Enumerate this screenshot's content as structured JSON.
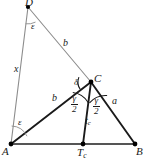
{
  "figure": {
    "type": "geometry-diagram",
    "width": 145,
    "height": 161,
    "background_color": "#ffffff",
    "colors": {
      "heavy_stroke": "#1a1a1a",
      "light_stroke": "#8c8c8c",
      "baseline_stroke": "#555555",
      "label_color": "#1a1a1a",
      "point_fill": "#000000"
    },
    "points": [
      {
        "id": "D",
        "label": "D",
        "x": 28,
        "y": 7
      },
      {
        "id": "C",
        "label": "C",
        "x": 91,
        "y": 82
      },
      {
        "id": "A",
        "label": "A",
        "x": 11,
        "y": 144
      },
      {
        "id": "B",
        "label": "B",
        "x": 135,
        "y": 144
      },
      {
        "id": "Tc",
        "label": "T",
        "sub": "c",
        "x": 83,
        "y": 144
      }
    ],
    "vertex_labels": [
      {
        "name": "vertex-label-D",
        "text": "D",
        "sub": "",
        "x": 25,
        "y": -3
      },
      {
        "name": "vertex-label-C",
        "text": "C",
        "sub": "",
        "x": 94,
        "y": 73
      },
      {
        "name": "vertex-label-A",
        "text": "A",
        "sub": "",
        "x": 2,
        "y": 146
      },
      {
        "name": "vertex-label-B",
        "text": "B",
        "sub": "",
        "x": 136,
        "y": 146
      },
      {
        "name": "vertex-label-Tc",
        "text": "T",
        "sub": "c",
        "x": 77,
        "y": 147
      }
    ],
    "segments": [
      {
        "name": "segment-A-D",
        "from": "A",
        "to": "D",
        "weight": "light"
      },
      {
        "name": "segment-D-C",
        "from": "D",
        "to": "C",
        "weight": "light"
      },
      {
        "name": "segment-A-C",
        "from": "A",
        "to": "C",
        "weight": "heavy"
      },
      {
        "name": "segment-C-B",
        "from": "C",
        "to": "B",
        "weight": "heavy"
      },
      {
        "name": "segment-A-B",
        "from": "A",
        "to": "B",
        "weight": "base"
      },
      {
        "name": "segment-C-Tc",
        "from": "C",
        "to": "Tc",
        "weight": "heavy"
      }
    ],
    "side_labels": [
      {
        "name": "side-label-x",
        "text": "x",
        "x": 14,
        "y": 64
      },
      {
        "name": "side-label-b-upper",
        "text": "b",
        "x": 63,
        "y": 38
      },
      {
        "name": "side-label-b-lower",
        "text": "b",
        "x": 52,
        "y": 93
      },
      {
        "name": "side-label-a",
        "text": "a",
        "x": 112,
        "y": 96
      }
    ],
    "angle_labels": [
      {
        "name": "angle-label-epsilon-D",
        "text": "ε",
        "x": 31,
        "y": 22
      },
      {
        "name": "angle-label-epsilon-A",
        "text": "ε",
        "x": 18,
        "y": 118
      },
      {
        "name": "angle-label-delta",
        "text": "δ",
        "x": 74,
        "y": 78
      }
    ],
    "fraction_labels": [
      {
        "name": "angle-label-gamma-half-left",
        "numerator": "γ",
        "denominator": "2",
        "x": 71,
        "y": 94
      },
      {
        "name": "angle-label-gamma-half-right",
        "numerator": "γ",
        "denominator": "2",
        "x": 93,
        "y": 96
      }
    ],
    "segment_labels": [
      {
        "name": "bisector-label-tc",
        "text": "t",
        "sub": "c",
        "x": 85,
        "y": 116
      }
    ],
    "angle_arcs": [
      {
        "name": "arc-epsilon-at-D",
        "cx": 28,
        "cy": 7,
        "r": 17,
        "start_deg": 64,
        "end_deg": 98,
        "weight": "light"
      },
      {
        "name": "arc-epsilon-at-A",
        "cx": 11,
        "cy": 144,
        "r": 18,
        "start_deg": 272,
        "end_deg": 333,
        "weight": "light"
      },
      {
        "name": "arc-delta-at-C",
        "cx": 91,
        "cy": 82,
        "r": 13,
        "start_deg": 158,
        "end_deg": 214,
        "weight": "heavy"
      },
      {
        "name": "arc-gamma-half-left",
        "cx": 91,
        "cy": 82,
        "r": 21,
        "start_deg": 97,
        "end_deg": 150,
        "weight": "heavy"
      },
      {
        "name": "arc-gamma-half-right",
        "cx": 91,
        "cy": 82,
        "r": 21,
        "start_deg": 40,
        "end_deg": 94,
        "weight": "heavy"
      }
    ]
  }
}
